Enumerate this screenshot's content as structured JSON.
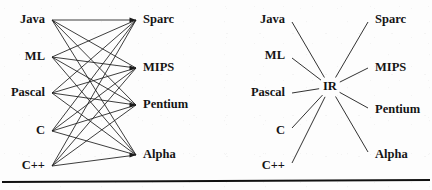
{
  "figure": {
    "caption": "",
    "background_color": "#fdfdfd",
    "line_color": "#1b1b1b",
    "text_color": "#151515"
  },
  "diagram_left": {
    "name": "direct-translation-diagram",
    "sources": [
      {
        "label": "Java",
        "x": 45,
        "y": 20,
        "anchor_x": 52,
        "anchor_y": 20
      },
      {
        "label": "ML",
        "x": 45,
        "y": 57,
        "anchor_x": 52,
        "anchor_y": 57
      },
      {
        "label": "Pascal",
        "x": 45,
        "y": 93,
        "anchor_x": 52,
        "anchor_y": 93
      },
      {
        "label": "C",
        "x": 45,
        "y": 131,
        "anchor_x": 52,
        "anchor_y": 131
      },
      {
        "label": "C++",
        "x": 45,
        "y": 166,
        "anchor_x": 52,
        "anchor_y": 166
      }
    ],
    "targets": [
      {
        "label": "Sparc",
        "x": 143,
        "y": 20,
        "anchor_x": 136,
        "anchor_y": 20
      },
      {
        "label": "MIPS",
        "x": 143,
        "y": 68,
        "anchor_x": 136,
        "anchor_y": 68
      },
      {
        "label": "Pentium",
        "x": 143,
        "y": 105,
        "anchor_x": 136,
        "anchor_y": 105
      },
      {
        "label": "Alpha",
        "x": 143,
        "y": 155,
        "anchor_x": 136,
        "anchor_y": 155
      }
    ],
    "edge_count": 20,
    "description": "every source language connects to every target architecture"
  },
  "diagram_right": {
    "name": "intermediate-representation-diagram",
    "hub": {
      "label": "IR",
      "x": 330,
      "y": 87
    },
    "sources": [
      {
        "label": "Java",
        "x": 285,
        "y": 20,
        "anchor_x": 292,
        "anchor_y": 22
      },
      {
        "label": "ML",
        "x": 285,
        "y": 56,
        "anchor_x": 292,
        "anchor_y": 58
      },
      {
        "label": "Pascal",
        "x": 285,
        "y": 93,
        "anchor_x": 292,
        "anchor_y": 93
      },
      {
        "label": "C",
        "x": 285,
        "y": 131,
        "anchor_x": 292,
        "anchor_y": 128
      },
      {
        "label": "C++",
        "x": 285,
        "y": 166,
        "anchor_x": 292,
        "anchor_y": 163
      }
    ],
    "targets": [
      {
        "label": "Sparc",
        "x": 375,
        "y": 20,
        "anchor_x": 368,
        "anchor_y": 22
      },
      {
        "label": "MIPS",
        "x": 375,
        "y": 68,
        "anchor_x": 368,
        "anchor_y": 68
      },
      {
        "label": "Pentium",
        "x": 375,
        "y": 110,
        "anchor_x": 368,
        "anchor_y": 108
      },
      {
        "label": "Alpha",
        "x": 375,
        "y": 155,
        "anchor_x": 368,
        "anchor_y": 152
      }
    ],
    "edge_count": 9,
    "description": "all source languages and target architectures connect through a single IR node"
  },
  "footer_rule": {
    "name": "page-divider",
    "y": 180,
    "thickness": 1.6
  }
}
